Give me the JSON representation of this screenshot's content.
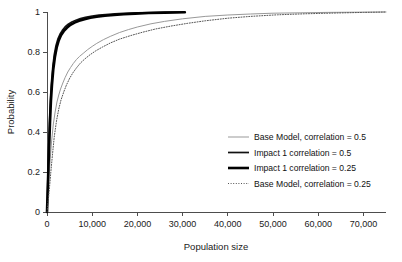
{
  "chart_data": {
    "type": "line",
    "title": "",
    "xlabel": "Population size",
    "ylabel": "Probability",
    "xlim": [
      0,
      75000
    ],
    "ylim": [
      0,
      1
    ],
    "grid": false,
    "legend_position": "center-right",
    "xticks": [
      0,
      10000,
      20000,
      30000,
      40000,
      50000,
      60000,
      70000
    ],
    "xtick_labels": [
      "0",
      "10,000",
      "20,000",
      "30,000",
      "40,000",
      "50,000",
      "60,000",
      "70,000"
    ],
    "yticks": [
      0,
      0.2,
      0.4,
      0.6,
      0.8,
      1
    ],
    "ytick_labels": [
      "0",
      "0.2",
      "0.4",
      "0.6",
      "0.8",
      "1"
    ],
    "series": [
      {
        "name": "Base Model, correlation = 0.5",
        "style": "solid-thin",
        "color": "#999999",
        "width": 1.0,
        "x": [
          0,
          200,
          400,
          700,
          1000,
          1400,
          1800,
          2200,
          2600,
          3000,
          3500,
          4000,
          4600,
          5200,
          5800,
          6500,
          7200,
          8000,
          9000,
          10000,
          11000,
          12500,
          14000,
          16000,
          18000,
          20000,
          23000,
          26000,
          30000,
          35000,
          40000,
          45000,
          50000,
          56000,
          62000,
          68000,
          75000
        ],
        "y": [
          0,
          0.07,
          0.15,
          0.26,
          0.35,
          0.44,
          0.5,
          0.55,
          0.585,
          0.615,
          0.645,
          0.672,
          0.7,
          0.722,
          0.742,
          0.762,
          0.778,
          0.793,
          0.812,
          0.828,
          0.843,
          0.862,
          0.878,
          0.897,
          0.912,
          0.925,
          0.941,
          0.953,
          0.966,
          0.978,
          0.985,
          0.99,
          0.994,
          0.996,
          0.998,
          0.999,
          1.0
        ]
      },
      {
        "name": "Impact 1 correlation = 0.5",
        "style": "solid-medium",
        "color": "#111111",
        "width": 1.7,
        "x": [
          0,
          120,
          250,
          400,
          600,
          800,
          1000,
          1300,
          1600,
          2000,
          2400,
          2900,
          3400,
          4000,
          4700,
          5500,
          6400,
          7400,
          8500,
          10000,
          11500,
          13000,
          15000,
          17000,
          20000,
          23000,
          26000,
          30000
        ],
        "y": [
          0,
          0.1,
          0.22,
          0.34,
          0.48,
          0.58,
          0.65,
          0.73,
          0.785,
          0.833,
          0.864,
          0.89,
          0.908,
          0.925,
          0.939,
          0.95,
          0.959,
          0.967,
          0.973,
          0.98,
          0.984,
          0.987,
          0.991,
          0.993,
          0.996,
          0.997,
          0.998,
          0.999
        ]
      },
      {
        "name": "Impact 1 correlation = 0.25",
        "style": "solid-thick",
        "color": "#000000",
        "width": 2.6,
        "x": [
          0,
          130,
          280,
          450,
          650,
          870,
          1100,
          1400,
          1750,
          2150,
          2600,
          3100,
          3700,
          4400,
          5200,
          6100,
          7100,
          8300,
          9600,
          11000,
          12800,
          14800,
          17000,
          19500,
          22500,
          26000,
          30500
        ],
        "y": [
          0,
          0.09,
          0.2,
          0.31,
          0.44,
          0.555,
          0.635,
          0.715,
          0.775,
          0.823,
          0.858,
          0.884,
          0.904,
          0.921,
          0.936,
          0.947,
          0.956,
          0.964,
          0.971,
          0.976,
          0.981,
          0.985,
          0.989,
          0.992,
          0.995,
          0.997,
          0.999
        ]
      },
      {
        "name": "Base Model, correlation = 0.25",
        "style": "dotted",
        "color": "#555555",
        "width": 1.0,
        "x": [
          0,
          250,
          500,
          850,
          1200,
          1600,
          2100,
          2600,
          3100,
          3700,
          4300,
          5000,
          5700,
          6500,
          7400,
          8400,
          9500,
          10800,
          12200,
          14000,
          16000,
          18500,
          21000,
          24000,
          27500,
          31000,
          35000,
          40000,
          45000,
          51000,
          57000,
          64000,
          70000,
          75000
        ],
        "y": [
          0,
          0.05,
          0.11,
          0.2,
          0.285,
          0.375,
          0.455,
          0.515,
          0.56,
          0.6,
          0.635,
          0.668,
          0.695,
          0.72,
          0.745,
          0.766,
          0.786,
          0.806,
          0.824,
          0.845,
          0.864,
          0.882,
          0.898,
          0.915,
          0.93,
          0.943,
          0.956,
          0.969,
          0.978,
          0.986,
          0.991,
          0.995,
          0.998,
          1.0
        ]
      }
    ]
  },
  "legend": {
    "entries": [
      {
        "label": "Base Model, correlation = 0.5"
      },
      {
        "label": "Impact 1 correlation = 0.5"
      },
      {
        "label": "Impact 1 correlation = 0.25"
      },
      {
        "label": "Base Model, correlation = 0.25"
      }
    ]
  }
}
